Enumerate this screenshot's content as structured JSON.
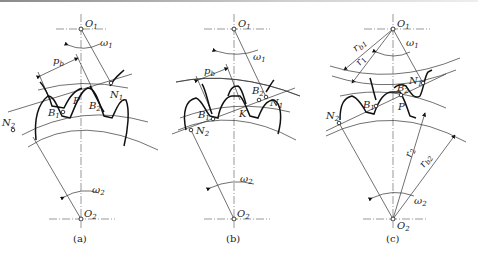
{
  "figure": {
    "type": "gear meshing diagram",
    "panels": [
      {
        "id": "a",
        "caption": "(a)",
        "labels": {
          "o1": "O",
          "o1_sub": "1",
          "o2": "O",
          "o2_sub": "2",
          "w1": "ω",
          "w1_sub": "1",
          "w2": "ω",
          "w2_sub": "2",
          "pb": "p",
          "pb_sub": "b",
          "n1": "N",
          "n1_sub": "1",
          "n2": "N",
          "n2_sub": "2",
          "b1": "B",
          "b1_sub": "1",
          "b2": "B",
          "b2_sub": "2",
          "p": "P"
        }
      },
      {
        "id": "b",
        "caption": "(b)",
        "labels": {
          "o1": "O",
          "o1_sub": "1",
          "o2": "O",
          "o2_sub": "2",
          "w1": "ω",
          "w1_sub": "1",
          "w2": "ω",
          "w2_sub": "2",
          "pb": "p",
          "pb_sub": "b",
          "n1": "N",
          "n1_sub": "1",
          "n2": "N",
          "n2_sub": "2",
          "b1": "B",
          "b1_sub": "1",
          "b2": "B",
          "b2_sub": "2",
          "k": "K"
        }
      },
      {
        "id": "c",
        "caption": "(c)",
        "labels": {
          "o1": "O",
          "o1_sub": "1",
          "o2": "O",
          "o2_sub": "2",
          "w1": "ω",
          "w1_sub": "1",
          "w2": "ω",
          "w2_sub": "2",
          "rb1": "r",
          "rb1_sub": "b1",
          "r1": "r",
          "r1_sub": "1",
          "r2": "r",
          "r2_sub": "2",
          "rb2": "r",
          "rb2_sub": "b2",
          "n1": "N",
          "n1_sub": "1",
          "n2": "N",
          "n2_sub": "2",
          "b1": "B",
          "b1_sub": "1",
          "b2": "B",
          "b2_sub": "2",
          "p": "P"
        }
      }
    ]
  }
}
